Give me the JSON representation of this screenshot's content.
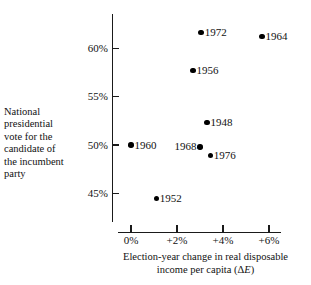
{
  "chart_data": {
    "type": "scatter",
    "title": "",
    "xlabel": "Election-year change in real disposable income per capita (ΔE)",
    "ylabel": "National presidential vote for the candidate of the incumbent party",
    "xlim": [
      -0.6,
      7.1
    ],
    "ylim": [
      42.6,
      63.2
    ],
    "grid": false,
    "legend": "none",
    "xticks": [
      0,
      2,
      4,
      6
    ],
    "xtick_labels": [
      "0%",
      "+2%",
      "+4%",
      "+6%"
    ],
    "yticks": [
      45,
      50,
      55,
      60
    ],
    "ytick_labels": [
      "45%",
      "50%",
      "55%",
      "60%"
    ],
    "point_label_field": "year",
    "points": [
      {
        "year": "1972",
        "x": 3.05,
        "y": 61.6,
        "label_side": "right"
      },
      {
        "year": "1964",
        "x": 5.7,
        "y": 61.2,
        "label_side": "right"
      },
      {
        "year": "1956",
        "x": 2.7,
        "y": 57.7,
        "label_side": "right"
      },
      {
        "year": "1948",
        "x": 3.3,
        "y": 52.3,
        "label_side": "right"
      },
      {
        "year": "1960",
        "x": 0.0,
        "y": 50.0,
        "label_side": "right"
      },
      {
        "year": "1968",
        "x": 3.0,
        "y": 49.8,
        "label_side": "left"
      },
      {
        "year": "1976",
        "x": 3.45,
        "y": 48.9,
        "label_side": "right"
      },
      {
        "year": "1952",
        "x": 1.1,
        "y": 44.5,
        "label_side": "right"
      }
    ]
  },
  "axis_caption": {
    "x_line1": "Election-year change in real disposable",
    "x_line2_prefix": "income per capita (Δ",
    "x_line2_italic": "E",
    "x_line2_suffix": ")",
    "y_block": "National presidential vote for the candidate of the incumbent party"
  },
  "colors": {
    "ink": "#1a1a1a",
    "point": "#000000",
    "background": "#ffffff"
  }
}
